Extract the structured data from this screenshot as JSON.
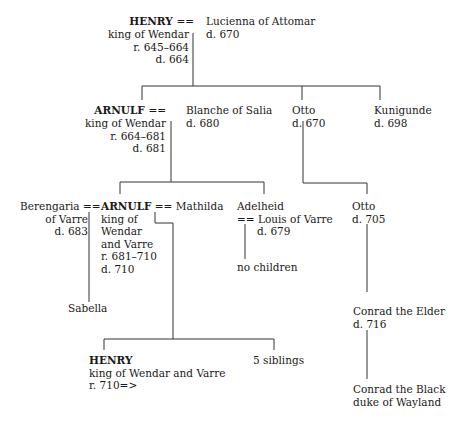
{
  "people": {
    "henry1": {
      "name": "HENRY",
      "spouse_sep": "==",
      "lines": [
        "king of Wendar",
        "r. 645–664",
        "d. 664"
      ]
    },
    "lucienna": {
      "name": "Lucienna of Attomar",
      "lines": [
        "d. 670"
      ]
    },
    "arnulf1": {
      "name": "ARNULF",
      "spouse_sep": "==",
      "lines": [
        "king of Wendar",
        "r. 664–681",
        "d. 681"
      ]
    },
    "blanche": {
      "name": "Blanche of Salia",
      "lines": [
        "d. 680"
      ]
    },
    "otto1": {
      "name": "Otto",
      "lines": [
        "d. 670"
      ]
    },
    "kunigunde": {
      "name": "Kunigunde",
      "lines": [
        "d. 698"
      ]
    },
    "berengaria": {
      "name": "Berengaria",
      "spouse_sep": "==",
      "lines": [
        "of Varre",
        "d. 683"
      ]
    },
    "arnulf2": {
      "name": "ARNULF",
      "spouse_sep": "==",
      "lines": [
        "king of",
        "Wendar",
        "and Varre",
        "r. 681–710",
        "d. 710"
      ]
    },
    "mathilda": {
      "name": "Mathilda"
    },
    "adelheid": {
      "name": "Adelheid",
      "spouse_sep": "=="
    },
    "louis": {
      "name": "Louis of Varre",
      "lines": [
        "d. 679"
      ]
    },
    "no_children": {
      "name": "no children"
    },
    "otto2": {
      "name": "Otto",
      "lines": [
        "d. 705"
      ]
    },
    "sabella": {
      "name": "Sabella"
    },
    "conrad_elder": {
      "name": "Conrad the Elder",
      "lines": [
        "d. 716"
      ]
    },
    "henry2": {
      "name": "HENRY",
      "lines": [
        "king of Wendar and Varre",
        "r. 710=>"
      ]
    },
    "siblings": {
      "name": "5 siblings"
    },
    "conrad_black": {
      "name": "Conrad the Black",
      "lines": [
        "duke of Wayland"
      ]
    }
  }
}
